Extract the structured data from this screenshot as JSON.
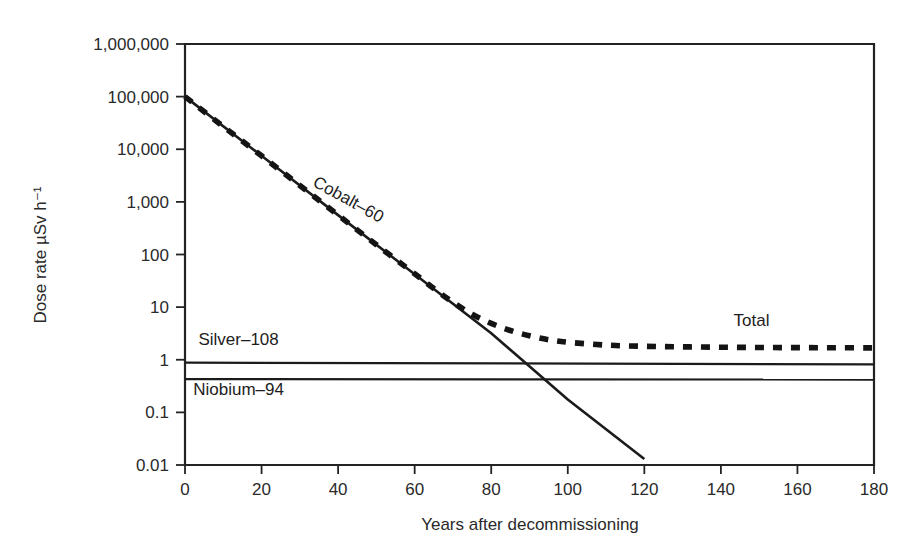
{
  "chart_data": {
    "type": "line",
    "title": "",
    "xlabel": "Years after decommissioning",
    "ylabel": "Dose rate µSv h⁻¹",
    "xlim": [
      0,
      180
    ],
    "ylim": [
      0.01,
      1000000
    ],
    "yscale": "log",
    "xscale": "linear",
    "grid": false,
    "legend_position": "inline-annotations",
    "xticks": [
      0,
      20,
      40,
      60,
      80,
      100,
      120,
      140,
      160,
      180
    ],
    "xtick_labels": [
      "0",
      "20",
      "40",
      "60",
      "80",
      "100",
      "120",
      "140",
      "160",
      "180"
    ],
    "yticks": [
      1000000,
      100000,
      10000,
      1000,
      100,
      10,
      1,
      0.1,
      0.01
    ],
    "ytick_labels": [
      "1,000,000",
      "100,000",
      "10,000",
      "1,000",
      "100",
      "10",
      "1",
      "0.1",
      "0.01"
    ],
    "series": [
      {
        "name": "Cobalt-60",
        "style": "solid",
        "label_text": "Cobalt–60",
        "label_x": 42,
        "label_y": 900,
        "label_rotation": 29,
        "x": [
          0,
          20,
          40,
          60,
          80,
          100,
          120
        ],
        "values": [
          100000,
          7500,
          560,
          42,
          3.2,
          0.175,
          0.013
        ]
      },
      {
        "name": "Silver-108",
        "style": "solid-thin",
        "label_text": "Silver–108",
        "label_x": 14,
        "label_y": 1.9,
        "label_rotation": 0,
        "x": [
          0,
          180
        ],
        "values": [
          0.88,
          0.82
        ]
      },
      {
        "name": "Niobium-94",
        "style": "solid-thin",
        "label_text": "Niobium–94",
        "label_x": 14,
        "label_y": 0.215,
        "label_rotation": 0,
        "x": [
          0,
          180
        ],
        "values": [
          0.43,
          0.42
        ]
      },
      {
        "name": "Total",
        "style": "dashed",
        "label_text": "Total",
        "label_x": 148,
        "label_y": 4.4,
        "label_rotation": 0,
        "x": [
          0,
          10,
          20,
          30,
          40,
          50,
          60,
          65,
          70,
          75,
          80,
          85,
          90,
          95,
          100,
          110,
          120,
          130,
          140,
          150,
          160,
          170,
          180
        ],
        "values": [
          100000,
          27000,
          7500,
          2050,
          560,
          153,
          43,
          22.5,
          12.4,
          7.3,
          4.9,
          3.6,
          2.85,
          2.4,
          2.15,
          1.9,
          1.8,
          1.76,
          1.73,
          1.71,
          1.7,
          1.69,
          1.68
        ]
      }
    ]
  },
  "annotations": {
    "cobalt_label": "Cobalt–60",
    "silver_label": "Silver–108",
    "niobium_label": "Niobium–94",
    "total_label": "Total"
  },
  "axes": {
    "x_title": "Years after decommissioning",
    "y_title": "Dose rate µSv h⁻¹",
    "x_tick_0": "0",
    "x_tick_1": "20",
    "x_tick_2": "40",
    "x_tick_3": "60",
    "x_tick_4": "80",
    "x_tick_5": "100",
    "x_tick_6": "120",
    "x_tick_7": "140",
    "x_tick_8": "160",
    "x_tick_9": "180",
    "y_tick_0": "1,000,000",
    "y_tick_1": "100,000",
    "y_tick_2": "10,000",
    "y_tick_3": "1,000",
    "y_tick_4": "100",
    "y_tick_5": "10",
    "y_tick_6": "1",
    "y_tick_7": "0.1",
    "y_tick_8": "0.01"
  },
  "colors": {
    "ink": "#1b1b1b",
    "axis": "#232323",
    "background": "#ffffff"
  }
}
